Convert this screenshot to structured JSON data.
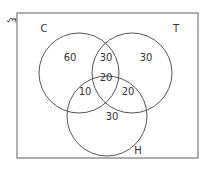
{
  "diagram": {
    "type": "venn-3",
    "universal_set": {
      "symbol": "ξ",
      "rect": {
        "x": 17,
        "y": 13,
        "width": 181,
        "height": 145
      }
    },
    "colors": {
      "stroke": "#555555",
      "rect_stroke": "#7a7a7a",
      "text": "#333333",
      "background": "#ffffff"
    },
    "sets": [
      {
        "id": "C",
        "label": "C",
        "cx": 79,
        "cy": 73,
        "r": 40,
        "label_x": 44,
        "label_y": 32
      },
      {
        "id": "T",
        "label": "T",
        "cx": 132,
        "cy": 73,
        "r": 40,
        "label_x": 176,
        "label_y": 32
      },
      {
        "id": "H",
        "label": "H",
        "cx": 107,
        "cy": 116,
        "r": 40,
        "label_x": 138,
        "label_y": 154
      }
    ],
    "regions": [
      {
        "name": "C-only",
        "value": "60",
        "x": 70,
        "y": 61
      },
      {
        "name": "C-and-T-only",
        "value": "30",
        "x": 106,
        "y": 61
      },
      {
        "name": "T-only",
        "value": "30",
        "x": 146,
        "y": 61
      },
      {
        "name": "C-and-T-and-H",
        "value": "20",
        "x": 106,
        "y": 81
      },
      {
        "name": "C-and-H-only",
        "value": "10",
        "x": 85,
        "y": 95
      },
      {
        "name": "T-and-H-only",
        "value": "20",
        "x": 128,
        "y": 95
      },
      {
        "name": "H-only",
        "value": "30",
        "x": 112,
        "y": 120
      }
    ]
  }
}
